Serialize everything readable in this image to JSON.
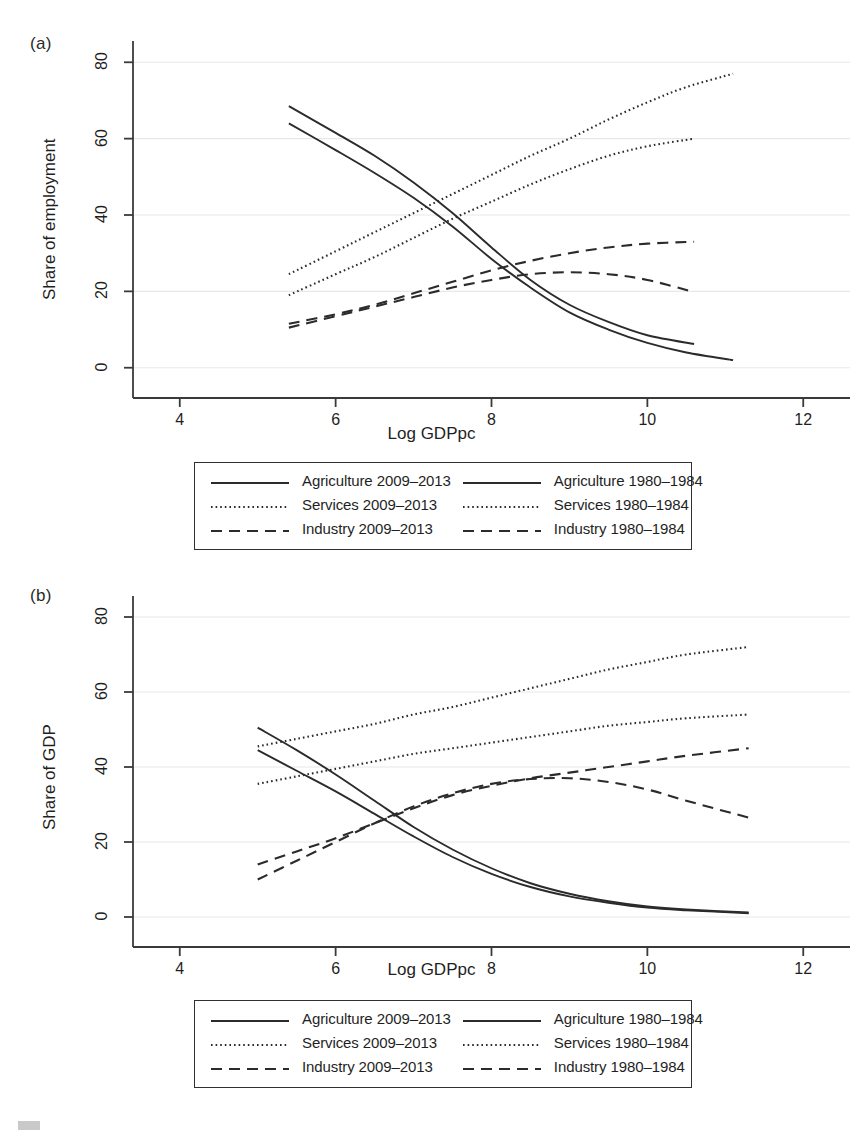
{
  "figure": {
    "panels": [
      {
        "id": "a",
        "label": "(a)",
        "ylabel": "Share of employment",
        "xlabel": "Log GDPpc"
      },
      {
        "id": "b",
        "label": "(b)",
        "ylabel": "Share of GDP",
        "xlabel": "Log GDPpc"
      }
    ],
    "legend": {
      "items": [
        {
          "label": "Agriculture 2009–2013",
          "style": "solid",
          "col": 0,
          "row": 0
        },
        {
          "label": "Agriculture 1980–1984",
          "style": "solid",
          "col": 1,
          "row": 0
        },
        {
          "label": "Services 2009–2013",
          "style": "dotted",
          "col": 0,
          "row": 1
        },
        {
          "label": "Services 1980–1984",
          "style": "dotted",
          "col": 1,
          "row": 1
        },
        {
          "label": "Industry 2009–2013",
          "style": "dashed",
          "col": 0,
          "row": 2
        },
        {
          "label": "Industry 1980–1984",
          "style": "dashed",
          "col": 1,
          "row": 2
        }
      ]
    },
    "colors": {
      "line": "#2b2b2b",
      "axis": "#3a3a3a",
      "grid": "#e8e8e8",
      "background": "#ffffff"
    }
  },
  "chart_data": [
    {
      "type": "line",
      "panel": "a",
      "title": "(a)",
      "xlabel": "Log GDPpc",
      "ylabel": "Share of employment",
      "xlim": [
        3.4,
        12.6
      ],
      "ylim": [
        -4,
        84
      ],
      "xticks": [
        4,
        6,
        8,
        10,
        12
      ],
      "yticks": [
        0,
        20,
        40,
        60,
        80
      ],
      "grid": "horizontal",
      "legend_position": "below",
      "series": [
        {
          "name": "Agriculture 2009–2013",
          "style": "solid",
          "x": [
            5.4,
            6.0,
            6.5,
            7.0,
            7.5,
            8.0,
            8.5,
            9.0,
            9.5,
            10.0,
            10.5,
            11.1
          ],
          "y": [
            64.0,
            57.0,
            51.0,
            44.5,
            37.0,
            28.5,
            21.0,
            14.5,
            10.0,
            6.5,
            4.0,
            2.0
          ]
        },
        {
          "name": "Agriculture 1980–1984",
          "style": "solid",
          "x": [
            5.4,
            6.0,
            6.5,
            7.0,
            7.5,
            8.0,
            8.5,
            9.0,
            9.5,
            10.0,
            10.6
          ],
          "y": [
            68.5,
            61.5,
            55.5,
            48.5,
            40.5,
            31.5,
            23.0,
            16.5,
            12.0,
            8.5,
            6.2
          ]
        },
        {
          "name": "Services 2009–2013",
          "style": "dotted",
          "x": [
            5.4,
            6.0,
            6.5,
            7.0,
            7.5,
            8.0,
            8.5,
            9.0,
            9.5,
            10.0,
            10.5,
            11.1
          ],
          "y": [
            24.5,
            30.5,
            35.5,
            40.5,
            45.5,
            50.5,
            55.5,
            60.0,
            65.0,
            69.5,
            73.5,
            77.0
          ]
        },
        {
          "name": "Services 1980–1984",
          "style": "dotted",
          "x": [
            5.4,
            6.0,
            6.5,
            7.0,
            7.5,
            8.0,
            8.5,
            9.0,
            9.5,
            10.0,
            10.6
          ],
          "y": [
            19.0,
            24.5,
            29.0,
            34.0,
            39.0,
            43.5,
            48.0,
            52.0,
            55.5,
            58.0,
            60.0
          ]
        },
        {
          "name": "Industry 2009–2013",
          "style": "dashed",
          "x": [
            5.4,
            6.0,
            6.5,
            7.0,
            7.5,
            8.0,
            8.5,
            9.0,
            9.5,
            10.0,
            10.6
          ],
          "y": [
            11.5,
            14.0,
            16.5,
            19.5,
            22.5,
            25.5,
            28.0,
            30.0,
            31.5,
            32.5,
            33.0
          ]
        },
        {
          "name": "Industry 1980–1984",
          "style": "dashed",
          "x": [
            5.4,
            6.0,
            6.5,
            7.0,
            7.5,
            8.0,
            8.5,
            9.0,
            9.5,
            10.0,
            10.6
          ],
          "y": [
            10.5,
            13.5,
            16.0,
            18.5,
            21.0,
            23.0,
            24.5,
            25.0,
            24.5,
            23.0,
            19.8
          ]
        }
      ]
    },
    {
      "type": "line",
      "panel": "b",
      "title": "(b)",
      "xlabel": "Log GDPpc",
      "ylabel": "Share of GDP",
      "xlim": [
        3.4,
        12.6
      ],
      "ylim": [
        -4,
        84
      ],
      "xticks": [
        4,
        6,
        8,
        10,
        12
      ],
      "yticks": [
        0,
        20,
        40,
        60,
        80
      ],
      "grid": "horizontal",
      "legend_position": "below",
      "series": [
        {
          "name": "Agriculture 2009–2013",
          "style": "solid",
          "x": [
            5.0,
            5.5,
            6.0,
            6.5,
            7.0,
            7.5,
            8.0,
            8.5,
            9.0,
            9.5,
            10.0,
            10.5,
            11.3
          ],
          "y": [
            44.5,
            39.0,
            33.5,
            27.5,
            21.5,
            16.0,
            11.5,
            8.0,
            5.5,
            3.8,
            2.5,
            1.8,
            1.0
          ]
        },
        {
          "name": "Agriculture 1980–1984",
          "style": "solid",
          "x": [
            5.0,
            5.5,
            6.0,
            6.5,
            7.0,
            7.5,
            8.0,
            8.5,
            9.0,
            9.5,
            10.0,
            10.5,
            11.3
          ],
          "y": [
            50.5,
            44.5,
            38.0,
            31.0,
            24.0,
            18.0,
            13.0,
            9.0,
            6.2,
            4.2,
            2.8,
            2.0,
            1.2
          ]
        },
        {
          "name": "Services 2009–2013",
          "style": "dotted",
          "x": [
            5.0,
            5.5,
            6.0,
            6.5,
            7.0,
            7.5,
            8.0,
            8.5,
            9.0,
            9.5,
            10.0,
            10.5,
            11.3
          ],
          "y": [
            45.5,
            47.5,
            49.5,
            51.5,
            54.0,
            56.0,
            58.5,
            61.0,
            63.5,
            66.0,
            68.0,
            70.0,
            72.0
          ]
        },
        {
          "name": "Services 1980–1984",
          "style": "dotted",
          "x": [
            5.0,
            5.5,
            6.0,
            6.5,
            7.0,
            7.5,
            8.0,
            8.5,
            9.0,
            9.5,
            10.0,
            10.5,
            11.3
          ],
          "y": [
            35.5,
            37.5,
            39.5,
            41.5,
            43.5,
            45.0,
            46.5,
            48.0,
            49.5,
            51.0,
            52.0,
            53.0,
            54.0
          ]
        },
        {
          "name": "Industry 2009–2013",
          "style": "dashed",
          "x": [
            5.0,
            5.5,
            6.0,
            6.5,
            7.0,
            7.5,
            8.0,
            8.5,
            9.0,
            9.5,
            10.0,
            10.5,
            11.3
          ],
          "y": [
            14.0,
            17.5,
            21.0,
            25.0,
            29.0,
            32.5,
            35.0,
            37.0,
            38.5,
            40.0,
            41.5,
            43.0,
            45.0
          ]
        },
        {
          "name": "Industry 1980–1984",
          "style": "dashed",
          "x": [
            5.0,
            5.5,
            6.0,
            6.5,
            7.0,
            7.5,
            8.0,
            8.5,
            9.0,
            9.5,
            10.0,
            10.5,
            11.3
          ],
          "y": [
            10.0,
            15.0,
            20.0,
            25.0,
            29.5,
            33.0,
            35.5,
            36.8,
            37.0,
            36.0,
            34.0,
            31.0,
            26.5
          ]
        }
      ]
    }
  ]
}
